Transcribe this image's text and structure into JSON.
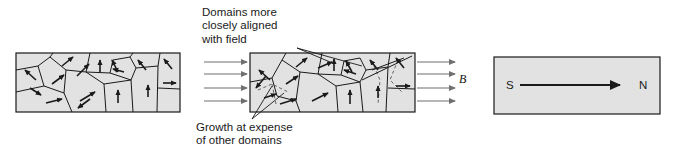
{
  "figure": {
    "type": "physics-diagram",
    "background_color": "#ffffff",
    "panel_fill": "#e2e2e2",
    "panel_stroke": "#1a1a1a",
    "arrow_color": "#1a1a1a",
    "field_arrow_color": "#6f6f6f"
  },
  "annotations": {
    "top": {
      "lines": [
        "Domains more",
        "closely aligned",
        "with field"
      ],
      "text": "Domains more closely aligned with field",
      "x": 202,
      "y": 6
    },
    "bottom": {
      "lines": [
        "Growth at expense",
        "of other domains"
      ],
      "text": "Growth at expense of other domains",
      "x": 196,
      "y": 121
    },
    "field_label": {
      "text": "B",
      "x": 459,
      "y": 72,
      "meaning": "applied magnetic field"
    }
  },
  "panels": [
    {
      "id": "panel-unmagnetized",
      "name": "unmagnetized-domains",
      "x": 16,
      "y": 53,
      "width": 164,
      "height": 59,
      "description": "Randomly oriented magnetic domains, no net magnetization"
    },
    {
      "id": "panel-partially-aligned",
      "name": "partially-aligned-domains",
      "x": 250,
      "y": 53,
      "width": 165,
      "height": 59,
      "description": "Domains aligned with applied field grow at the expense of others"
    },
    {
      "id": "panel-saturated",
      "name": "saturated-bar-magnet",
      "x": 494,
      "y": 57,
      "width": 166,
      "height": 57,
      "description": "Fully magnetized bar with south and north poles"
    }
  ],
  "poles": {
    "south": {
      "text": "S",
      "x": 506,
      "y": 79
    },
    "north": {
      "text": "N",
      "x": 639,
      "y": 79
    }
  },
  "field_arrows": {
    "count_left": 4,
    "count_right": 4,
    "left_x_start": 204,
    "left_x_end": 248,
    "right_x_start": 417,
    "right_x_end": 455,
    "y_positions": [
      62,
      74,
      88,
      101
    ]
  },
  "domain_arrows": {
    "panel_1_count": 16,
    "panel_2_count": 16,
    "note": "Short black arrows indicate magnetization direction of each domain"
  },
  "magnetization_arrow": {
    "x1": 520,
    "x2": 622,
    "y": 85,
    "direction": "south-to-north"
  }
}
